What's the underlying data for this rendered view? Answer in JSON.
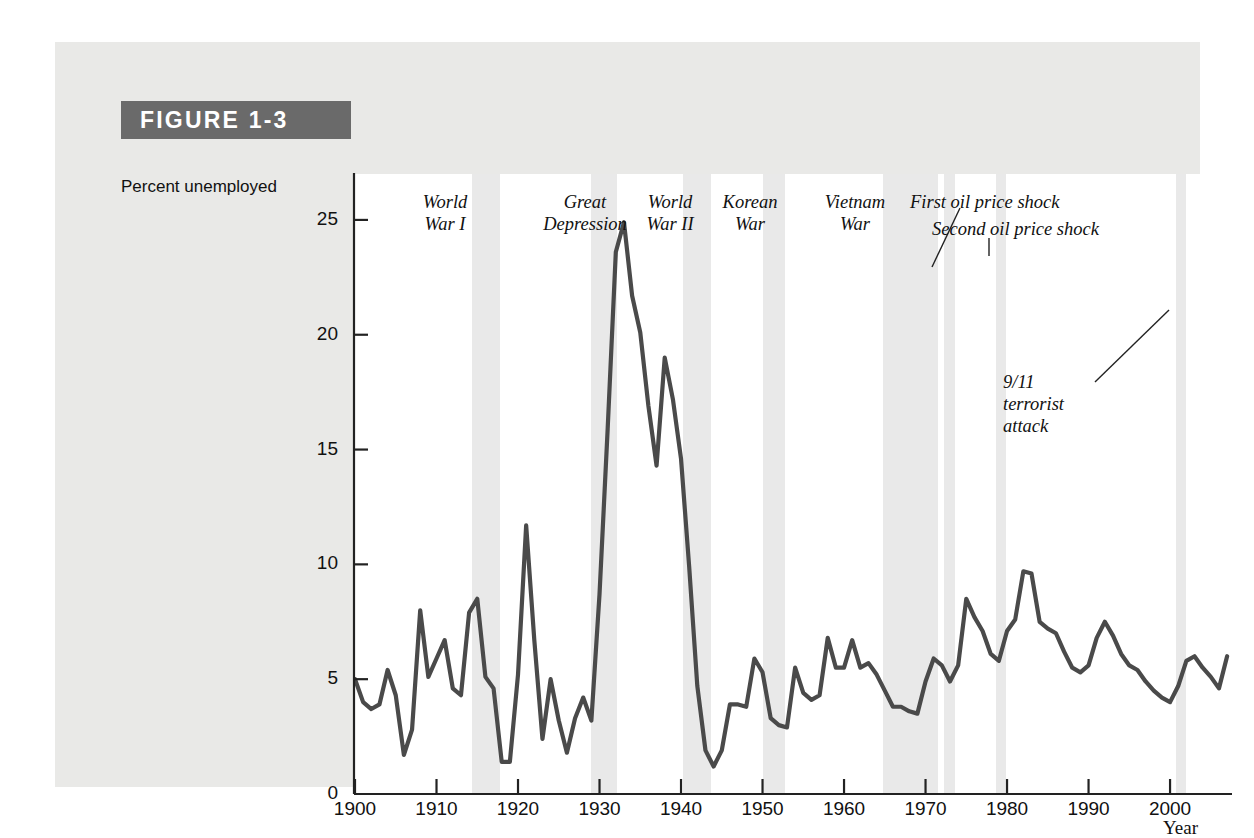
{
  "figure": {
    "label": "FIGURE 1-3"
  },
  "axes": {
    "ylabel": "Percent unemployed",
    "xlabel": "Year",
    "yticks": [
      "0",
      "5",
      "10",
      "15",
      "20",
      "25"
    ],
    "xticks": [
      "1900",
      "1910",
      "1920",
      "1930",
      "1940",
      "1950",
      "1960",
      "1970",
      "1980",
      "1990",
      "2000"
    ]
  },
  "annotations": [
    {
      "id": "world-war-i",
      "lines": [
        "World",
        "War I"
      ]
    },
    {
      "id": "great-depression",
      "lines": [
        "Great",
        "Depression"
      ]
    },
    {
      "id": "world-war-ii",
      "lines": [
        "World",
        "War II"
      ]
    },
    {
      "id": "korean-war",
      "lines": [
        "Korean",
        "War"
      ]
    },
    {
      "id": "vietnam-war",
      "lines": [
        "Vietnam",
        "War"
      ]
    },
    {
      "id": "first-oil-price-shock",
      "lines": [
        "First oil price shock"
      ]
    },
    {
      "id": "second-oil-price-shock",
      "lines": [
        "Second oil price shock"
      ]
    },
    {
      "id": "nine-eleven",
      "lines": [
        "9/11",
        "terrorist",
        "attack"
      ]
    }
  ],
  "chart_data": {
    "type": "line",
    "title": "FIGURE 1-3",
    "xlabel": "Year",
    "ylabel": "Percent unemployed",
    "xlim": [
      1900,
      2007
    ],
    "ylim": [
      0,
      27
    ],
    "yticks": [
      0,
      5,
      10,
      15,
      20,
      25
    ],
    "xticks": [
      1900,
      1910,
      1920,
      1930,
      1940,
      1950,
      1960,
      1970,
      1980,
      1990,
      2000
    ],
    "grid": false,
    "legend": null,
    "line_color": "#4a4a4a",
    "band_color": "#e9e9e9",
    "series": [
      {
        "name": "U.S. unemployment rate",
        "x": [
          1900,
          1901,
          1902,
          1903,
          1904,
          1905,
          1906,
          1907,
          1908,
          1909,
          1910,
          1911,
          1912,
          1913,
          1914,
          1915,
          1916,
          1917,
          1918,
          1919,
          1920,
          1921,
          1922,
          1923,
          1924,
          1925,
          1926,
          1927,
          1928,
          1929,
          1930,
          1931,
          1932,
          1933,
          1934,
          1935,
          1936,
          1937,
          1938,
          1939,
          1940,
          1941,
          1942,
          1943,
          1944,
          1945,
          1946,
          1947,
          1948,
          1949,
          1950,
          1951,
          1952,
          1953,
          1954,
          1955,
          1956,
          1957,
          1958,
          1959,
          1960,
          1961,
          1962,
          1963,
          1964,
          1965,
          1966,
          1967,
          1968,
          1969,
          1970,
          1971,
          1972,
          1973,
          1974,
          1975,
          1976,
          1977,
          1978,
          1979,
          1980,
          1981,
          1982,
          1983,
          1984,
          1985,
          1986,
          1987,
          1988,
          1989,
          1990,
          1991,
          1992,
          1993,
          1994,
          1995,
          1996,
          1997,
          1998,
          1999,
          2000,
          2001,
          2002,
          2003,
          2004,
          2005,
          2006,
          2007
        ],
        "y": [
          5.0,
          4.0,
          3.7,
          3.9,
          5.4,
          4.3,
          1.7,
          2.8,
          8.0,
          5.1,
          5.9,
          6.7,
          4.6,
          4.3,
          7.9,
          8.5,
          5.1,
          4.6,
          1.4,
          1.4,
          5.2,
          11.7,
          6.7,
          2.4,
          5.0,
          3.2,
          1.8,
          3.3,
          4.2,
          3.2,
          8.7,
          15.9,
          23.6,
          24.9,
          21.7,
          20.1,
          16.9,
          14.3,
          19.0,
          17.2,
          14.6,
          9.9,
          4.7,
          1.9,
          1.2,
          1.9,
          3.9,
          3.9,
          3.8,
          5.9,
          5.3,
          3.3,
          3.0,
          2.9,
          5.5,
          4.4,
          4.1,
          4.3,
          6.8,
          5.5,
          5.5,
          6.7,
          5.5,
          5.7,
          5.2,
          4.5,
          3.8,
          3.8,
          3.6,
          3.5,
          4.9,
          5.9,
          5.6,
          4.9,
          5.6,
          8.5,
          7.7,
          7.1,
          6.1,
          5.8,
          7.1,
          7.6,
          9.7,
          9.6,
          7.5,
          7.2,
          7.0,
          6.2,
          5.5,
          5.3,
          5.6,
          6.8,
          7.5,
          6.9,
          6.1,
          5.6,
          5.4,
          4.9,
          4.5,
          4.2,
          4.0,
          4.7,
          5.8,
          6.0,
          5.5,
          5.1,
          4.6,
          6.0
        ]
      }
    ],
    "shaded_bands": [
      {
        "name": "World War I",
        "start": 1914.4,
        "end": 1917.8
      },
      {
        "name": "Great Depression",
        "start": 1928.9,
        "end": 1932.2
      },
      {
        "name": "World War II",
        "start": 1940.3,
        "end": 1943.7
      },
      {
        "name": "Korean War",
        "start": 1950.0,
        "end": 1952.8
      },
      {
        "name": "Vietnam War",
        "start": 1964.8,
        "end": 1971.5
      },
      {
        "name": "First oil price shock",
        "start": 1972.3,
        "end": 1973.6
      },
      {
        "name": "Second oil price shock",
        "start": 1978.6,
        "end": 1979.9
      },
      {
        "name": "9/11 terrorist attack",
        "start": 2000.7,
        "end": 2002.0
      }
    ]
  }
}
